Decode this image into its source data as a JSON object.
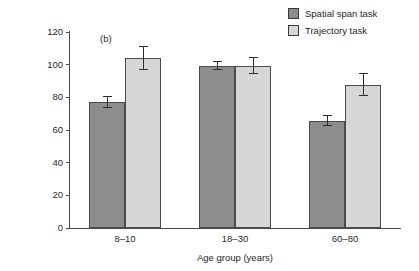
{
  "panel": {
    "label": "(b)"
  },
  "legend": {
    "position": "top-right",
    "entries": [
      {
        "label": "Spatial span task",
        "color": "#8d8d8d"
      },
      {
        "label": "Trajectory task",
        "color": "#d6d6d6"
      }
    ]
  },
  "axes": {
    "ylabel": "% of young adult mean performance",
    "xlabel": "Age group (years)",
    "yticks": [
      "0",
      "20",
      "40",
      "60",
      "80",
      "100",
      "120"
    ],
    "xcategories": [
      "8–10",
      "18–30",
      "60–80"
    ]
  },
  "chart_data": {
    "type": "bar",
    "title": "",
    "subtitle": "",
    "panel_label": "(b)",
    "categories": [
      "8–10",
      "18–30",
      "60–80"
    ],
    "series": [
      {
        "name": "Spatial span task",
        "color": "#8d8d8d",
        "values": [
          77,
          99,
          65.5
        ],
        "errors": [
          3.5,
          2.5,
          3
        ]
      },
      {
        "name": "Trajectory task",
        "color": "#d6d6d6",
        "values": [
          104,
          99,
          87.5
        ],
        "errors": [
          7,
          5,
          6.5
        ]
      }
    ],
    "xlabel": "Age group (years)",
    "ylabel": "% of young adult mean performance",
    "ylim": [
      0,
      120
    ],
    "ytick_step": 20,
    "grid": false,
    "legend_position": "top-right",
    "error_bar_style": "symmetric-capped"
  }
}
